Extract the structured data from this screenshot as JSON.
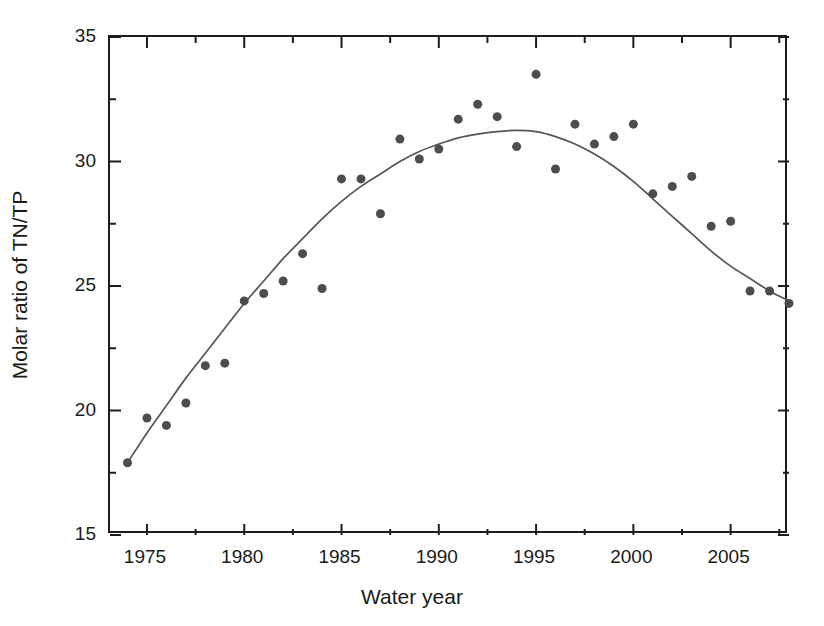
{
  "chart_data": {
    "type": "scatter",
    "title": "",
    "subtitle": "",
    "xlabel": "Water year",
    "ylabel": "Molar ratio of TN/TP",
    "xlim": [
      1973.1,
      2008.0
    ],
    "ylim": [
      15,
      35
    ],
    "x_ticks_major": [
      1975,
      1980,
      1985,
      1990,
      1995,
      2000,
      2005
    ],
    "x_tick_labels": [
      "1975",
      "1980",
      "1985",
      "1990",
      "1995",
      "2000",
      "2005"
    ],
    "x_ticks_minor": [
      1977.5,
      1982.5,
      1987.5,
      1992.5,
      1997.5,
      2002.5,
      2007.5
    ],
    "y_ticks_major": [
      15,
      20,
      25,
      30,
      35
    ],
    "y_tick_labels": [
      "15",
      "20",
      "25",
      "30",
      "35"
    ],
    "y_ticks_minor": [
      17.5,
      22.5,
      27.5,
      32.5
    ],
    "grid": false,
    "legend": null,
    "marker_color": "#4d4d4d",
    "line_color": "#555555",
    "axis_color": "#1d1d1d",
    "marker_size": 9,
    "x": [
      1974,
      1975,
      1976,
      1977,
      1978,
      1979,
      1980,
      1981,
      1982,
      1983,
      1984,
      1985,
      1986,
      1987,
      1988,
      1989,
      1990,
      1991,
      1992,
      1993,
      1994,
      1995,
      1996,
      1997,
      1998,
      1999,
      2000,
      2001,
      2002,
      2003,
      2004,
      2005,
      2006,
      2007,
      2008
    ],
    "y": [
      17.9,
      19.7,
      19.4,
      20.3,
      21.8,
      21.9,
      24.4,
      24.7,
      25.2,
      26.3,
      24.9,
      29.3,
      29.3,
      27.9,
      30.9,
      30.1,
      30.5,
      31.7,
      32.3,
      31.8,
      30.6,
      33.5,
      29.7,
      31.5,
      30.7,
      31.0,
      31.5,
      28.7,
      29.0,
      29.4,
      27.4,
      27.6,
      24.8,
      24.8,
      24.3
    ],
    "series": [
      {
        "name": "Molar ratio of TN/TP",
        "type": "scatter",
        "points": [
          {
            "x": 1974,
            "y": 17.9
          },
          {
            "x": 1975,
            "y": 19.7
          },
          {
            "x": 1976,
            "y": 19.4
          },
          {
            "x": 1977,
            "y": 20.3
          },
          {
            "x": 1978,
            "y": 21.8
          },
          {
            "x": 1979,
            "y": 21.9
          },
          {
            "x": 1980,
            "y": 24.4
          },
          {
            "x": 1981,
            "y": 24.7
          },
          {
            "x": 1982,
            "y": 25.2
          },
          {
            "x": 1983,
            "y": 26.3
          },
          {
            "x": 1984,
            "y": 24.9
          },
          {
            "x": 1985,
            "y": 29.3
          },
          {
            "x": 1986,
            "y": 29.3
          },
          {
            "x": 1987,
            "y": 27.9
          },
          {
            "x": 1988,
            "y": 30.9
          },
          {
            "x": 1989,
            "y": 30.1
          },
          {
            "x": 1990,
            "y": 30.5
          },
          {
            "x": 1991,
            "y": 31.7
          },
          {
            "x": 1992,
            "y": 32.3
          },
          {
            "x": 1993,
            "y": 31.8
          },
          {
            "x": 1994,
            "y": 30.6
          },
          {
            "x": 1995,
            "y": 33.5
          },
          {
            "x": 1996,
            "y": 29.7
          },
          {
            "x": 1997,
            "y": 31.5
          },
          {
            "x": 1998,
            "y": 30.7
          },
          {
            "x": 1999,
            "y": 31.0
          },
          {
            "x": 2000,
            "y": 31.5
          },
          {
            "x": 2001,
            "y": 28.7
          },
          {
            "x": 2002,
            "y": 29.0
          },
          {
            "x": 2003,
            "y": 29.4
          },
          {
            "x": 2004,
            "y": 27.4
          },
          {
            "x": 2005,
            "y": 27.6
          },
          {
            "x": 2006,
            "y": 24.8
          },
          {
            "x": 2007,
            "y": 24.8
          },
          {
            "x": 2008,
            "y": 24.3
          }
        ]
      },
      {
        "name": "smoothed trend",
        "type": "line",
        "points": [
          {
            "x": 1974.0,
            "y": 17.9
          },
          {
            "x": 1975.0,
            "y": 19.1
          },
          {
            "x": 1976.0,
            "y": 20.2
          },
          {
            "x": 1977.0,
            "y": 21.3
          },
          {
            "x": 1978.0,
            "y": 22.3
          },
          {
            "x": 1979.0,
            "y": 23.3
          },
          {
            "x": 1980.0,
            "y": 24.3
          },
          {
            "x": 1981.0,
            "y": 25.2
          },
          {
            "x": 1982.0,
            "y": 26.1
          },
          {
            "x": 1983.0,
            "y": 26.9
          },
          {
            "x": 1984.0,
            "y": 27.7
          },
          {
            "x": 1985.0,
            "y": 28.4
          },
          {
            "x": 1986.0,
            "y": 29.0
          },
          {
            "x": 1987.0,
            "y": 29.5
          },
          {
            "x": 1988.0,
            "y": 30.0
          },
          {
            "x": 1989.0,
            "y": 30.4
          },
          {
            "x": 1990.0,
            "y": 30.7
          },
          {
            "x": 1991.0,
            "y": 30.95
          },
          {
            "x": 1992.0,
            "y": 31.1
          },
          {
            "x": 1993.0,
            "y": 31.2
          },
          {
            "x": 1994.0,
            "y": 31.25
          },
          {
            "x": 1995.0,
            "y": 31.2
          },
          {
            "x": 1996.0,
            "y": 31.0
          },
          {
            "x": 1997.0,
            "y": 30.7
          },
          {
            "x": 1998.0,
            "y": 30.3
          },
          {
            "x": 1999.0,
            "y": 29.8
          },
          {
            "x": 2000.0,
            "y": 29.2
          },
          {
            "x": 2001.0,
            "y": 28.5
          },
          {
            "x": 2002.0,
            "y": 27.8
          },
          {
            "x": 2003.0,
            "y": 27.1
          },
          {
            "x": 2004.0,
            "y": 26.4
          },
          {
            "x": 2005.0,
            "y": 25.8
          },
          {
            "x": 2006.0,
            "y": 25.3
          },
          {
            "x": 2007.0,
            "y": 24.8
          },
          {
            "x": 2008.0,
            "y": 24.4
          }
        ]
      }
    ]
  }
}
